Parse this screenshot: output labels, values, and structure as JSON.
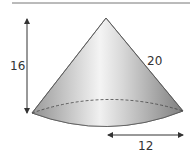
{
  "figure": {
    "shape": "cone",
    "labels": {
      "height": "16",
      "slant_height": "20",
      "radius": "12"
    },
    "colors": {
      "outline": "#555555",
      "fill_light": "#f2f2f2",
      "fill_dark": "#8a8a8a",
      "rule": "#777777"
    }
  }
}
